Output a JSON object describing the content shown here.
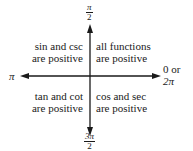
{
  "diagram": {
    "axes": {
      "top_label": {
        "numerator": "π",
        "denominator": "2"
      },
      "left_label": "π",
      "right_label_line1": "0 or",
      "right_label_line2": "2π",
      "bottom_label": {
        "numerator": "3π",
        "denominator": "2"
      }
    },
    "quadrants": [
      {
        "position": "top-left",
        "line1": "sin and csc",
        "line2": "are positive"
      },
      {
        "position": "top-right",
        "line1": "all functions",
        "line2": "are positive"
      },
      {
        "position": "bottom-left",
        "line1": "tan and cot",
        "line2": "are positive"
      },
      {
        "position": "bottom-right",
        "line1": "cos and sec",
        "line2": "are positive"
      }
    ],
    "colors": {
      "ink": "#1a1a1a",
      "background": "#ffffff"
    }
  }
}
